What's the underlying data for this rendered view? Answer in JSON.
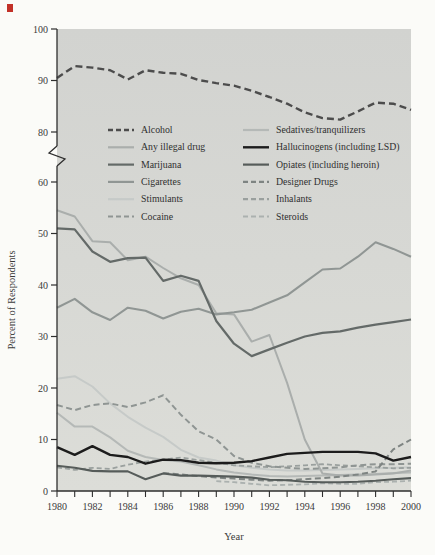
{
  "figure": {
    "page_bg": "#fbfbf8",
    "plot_bg_top": "#d2d3d0",
    "plot_bg_bottom": "#dcddd8",
    "axis_color": "#2e2e2e",
    "label_color": "#3a3a3a",
    "artifact_color": "#c23128",
    "plot": {
      "left": 57,
      "right": 411,
      "top": 29,
      "bottom": 491,
      "break_top": 146,
      "break_bottom": 166
    }
  },
  "axes": {
    "y_title": "Percent of Respondents",
    "x_title": "Year",
    "y_ticks_lower": [
      0,
      10,
      20,
      30,
      40,
      50,
      60
    ],
    "y_ticks_upper": [
      80,
      90,
      100
    ],
    "x_tick_labels": [
      1980,
      1982,
      1984,
      1986,
      1988,
      1990,
      1992,
      1994,
      1996,
      1998,
      2000
    ],
    "y_axis_break": "between 60 and 80"
  },
  "chart_data": {
    "type": "line",
    "title": "",
    "xlabel": "Year",
    "ylabel": "Percent of Respondents",
    "x": [
      1980,
      1981,
      1982,
      1983,
      1984,
      1985,
      1986,
      1987,
      1988,
      1989,
      1990,
      1991,
      1992,
      1993,
      1994,
      1995,
      1996,
      1997,
      1998,
      1999,
      2000
    ],
    "xlim": [
      1980,
      2000
    ],
    "ylim_lower_segment": [
      0,
      62
    ],
    "ylim_upper_segment": [
      80,
      100
    ],
    "grid": false,
    "legend_position": "inside top, two columns",
    "series": [
      {
        "id": "stimulants",
        "label": "Stimulants",
        "color": "#c6cac8",
        "width": 2,
        "dash": null,
        "values": [
          21.8,
          22.3,
          20.3,
          17,
          14.4,
          12.3,
          10.5,
          8,
          6.5,
          5.9,
          5,
          4.5,
          4.2,
          4,
          4,
          4.1,
          4.2,
          4.3,
          4.4,
          4.5,
          4.6
        ]
      },
      {
        "id": "sedatives",
        "label": "Sedatives/tranquilizers",
        "color": "#b5b9b7",
        "width": 2,
        "dash": null,
        "values": [
          15.2,
          12.5,
          12.5,
          10.4,
          7.8,
          6.6,
          6,
          5.7,
          5,
          4.2,
          3.6,
          3.2,
          2.9,
          2.8,
          2.9,
          3,
          3.1,
          3.2,
          3.3,
          3.5,
          3.6
        ]
      },
      {
        "id": "any_illegal_drug",
        "label": "Any illegal drug",
        "color": "#aaaeac",
        "width": 2,
        "dash": null,
        "values": [
          54.5,
          53.3,
          48.5,
          48.3,
          44.8,
          45.5,
          43.3,
          41.3,
          40,
          34.5,
          34.3,
          29,
          30.3,
          21,
          10,
          3.4,
          3,
          3,
          3.2,
          3.4,
          4
        ]
      },
      {
        "id": "inhalants",
        "label": "Inhalants",
        "color": "#9aa09e",
        "width": 1.8,
        "dash": "5,3",
        "values": [
          4.6,
          4.1,
          4.5,
          4.3,
          5.1,
          5.7,
          6.1,
          6.5,
          6,
          5.5,
          5,
          4.8,
          4.6,
          4.8,
          5,
          5.2,
          5,
          4.8,
          4.6,
          4.4,
          4.5
        ]
      },
      {
        "id": "steroids",
        "label": "Steroids",
        "color": "#abb1af",
        "width": 1.8,
        "dash": "5,3",
        "values": [
          null,
          null,
          null,
          null,
          null,
          null,
          null,
          null,
          null,
          1.9,
          1.7,
          1.4,
          1.1,
          1.2,
          1.3,
          1.5,
          1.4,
          1.4,
          1.7,
          1.8,
          2
        ]
      },
      {
        "id": "cocaine",
        "label": "Cocaine",
        "color": "#8f9593",
        "width": 2,
        "dash": "6,3.5",
        "values": [
          16.7,
          15.7,
          16.7,
          17,
          16.3,
          17.2,
          18.6,
          14.8,
          11.6,
          10,
          6.8,
          5.5,
          4.8,
          4.5,
          4.3,
          4.4,
          4.6,
          5,
          5.2,
          5.2,
          5.3
        ]
      },
      {
        "id": "designer_drugs",
        "label": "Designer Drugs",
        "color": "#7e8482",
        "width": 2,
        "dash": "6,3.5",
        "values": [
          null,
          null,
          null,
          null,
          null,
          null,
          3.5,
          3.2,
          2.9,
          2.6,
          2.4,
          2.2,
          2,
          2.1,
          2.3,
          2.5,
          2.8,
          3.2,
          3.8,
          8.1,
          10
        ]
      },
      {
        "id": "cigarettes",
        "label": "Cigarettes",
        "color": "#909694",
        "width": 2.1,
        "dash": null,
        "values": [
          35.6,
          37.3,
          34.7,
          33.2,
          35.6,
          35,
          33.5,
          34.8,
          35.4,
          34.3,
          34.7,
          35.2,
          36.6,
          38,
          40.5,
          43,
          43.2,
          45.5,
          48.3,
          47,
          45.5
        ]
      },
      {
        "id": "opiates",
        "label": "Opiates (including heroin)",
        "color": "#565c5a",
        "width": 2.1,
        "dash": null,
        "values": [
          4.9,
          4.5,
          3.9,
          3.8,
          3.8,
          2.3,
          3.4,
          3,
          3,
          2.9,
          2.8,
          2.6,
          2.2,
          2.1,
          1.8,
          1.7,
          1.7,
          1.8,
          2,
          2.3,
          2.5
        ]
      },
      {
        "id": "marijuana",
        "label": "Marijuana",
        "color": "#646a68",
        "width": 2.2,
        "dash": null,
        "values": [
          51,
          50.8,
          46.5,
          44.5,
          45.2,
          45.3,
          40.8,
          41.8,
          40.8,
          33,
          28.6,
          26.2,
          27.5,
          28.8,
          30,
          30.7,
          31,
          31.7,
          32.3,
          32.8,
          33.3
        ]
      },
      {
        "id": "hallucinogens",
        "label": "Hallucinogens (including LSD)",
        "color": "#1c1c1c",
        "width": 2.4,
        "dash": null,
        "values": [
          8.5,
          7,
          8.7,
          7,
          6.6,
          5.3,
          6.1,
          6,
          5.5,
          5.4,
          5.5,
          5.8,
          6.5,
          7.2,
          7.4,
          7.6,
          7.6,
          7.6,
          7.3,
          5.9,
          6.6
        ]
      },
      {
        "id": "alcohol",
        "label": "Alcohol",
        "color": "#4c4c4c",
        "width": 2.4,
        "dash": "7,4",
        "values": [
          90.5,
          92.8,
          92.5,
          92,
          90.2,
          92,
          91.5,
          91.3,
          90.1,
          89.5,
          89,
          88,
          86.8,
          85.5,
          83.8,
          82.7,
          82.4,
          84,
          85.7,
          85.5,
          84.3
        ]
      }
    ],
    "legend_columns": [
      [
        "alcohol",
        "any_illegal_drug",
        "marijuana",
        "cigarettes",
        "stimulants",
        "cocaine"
      ],
      [
        "sedatives",
        "hallucinogens",
        "opiates",
        "designer_drugs",
        "inhalants",
        "steroids"
      ]
    ]
  }
}
